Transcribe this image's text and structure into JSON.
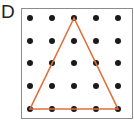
{
  "label": "D",
  "grid": {
    "rows": 5,
    "cols": 5,
    "dot_color": "#1a1a1a",
    "border_color": "#8c8c8c"
  },
  "triangle": {
    "stroke_color": "#e0703a",
    "vertices_grid": [
      [
        2,
        0
      ],
      [
        0,
        4
      ],
      [
        4,
        4
      ]
    ]
  }
}
